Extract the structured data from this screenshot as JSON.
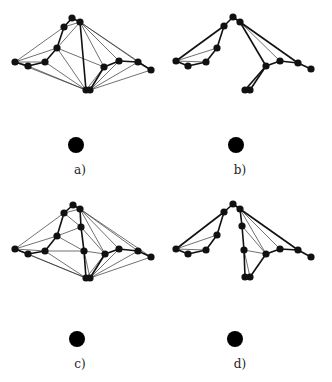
{
  "figure": {
    "panels": [
      {
        "id": "a",
        "label": "a)",
        "label_pos": [
          80,
          174
        ],
        "source_node": [
          76,
          145,
          8
        ],
        "nodes": {
          "t": [
            72,
            18
          ],
          "tl": [
            64,
            27
          ],
          "tr": [
            80,
            22
          ],
          "m": [
            57,
            48
          ],
          "l1": [
            15,
            62
          ],
          "l2": [
            28,
            66
          ],
          "l3": [
            45,
            62
          ],
          "r1": [
            104,
            67
          ],
          "r2": [
            119,
            61
          ],
          "r3": [
            138,
            62
          ],
          "r4": [
            151,
            70
          ],
          "b1": [
            86,
            90
          ],
          "b2": [
            90,
            90
          ]
        },
        "thick_edges": [
          [
            "t",
            "tl"
          ],
          [
            "t",
            "tr"
          ],
          [
            "tl",
            "m"
          ],
          [
            "m",
            "l3"
          ],
          [
            "l3",
            "l2"
          ],
          [
            "l2",
            "l1"
          ],
          [
            "tr",
            "b1"
          ],
          [
            "r1",
            "b2"
          ],
          [
            "r1",
            "r2"
          ],
          [
            "r2",
            "r3"
          ],
          [
            "r3",
            "r4"
          ]
        ],
        "thin_edges": [
          [
            "l1",
            "tl"
          ],
          [
            "l1",
            "m"
          ],
          [
            "l1",
            "l3"
          ],
          [
            "l1",
            "b1"
          ],
          [
            "l2",
            "b1"
          ],
          [
            "l3",
            "b1"
          ],
          [
            "m",
            "b1"
          ],
          [
            "m",
            "r1"
          ],
          [
            "m",
            "tr"
          ],
          [
            "tr",
            "r1"
          ],
          [
            "tr",
            "r2"
          ],
          [
            "tr",
            "r3"
          ],
          [
            "tr",
            "r4"
          ],
          [
            "r1",
            "b1"
          ],
          [
            "r2",
            "b2"
          ],
          [
            "r3",
            "b2"
          ],
          [
            "r4",
            "b2"
          ],
          [
            "tl",
            "tr"
          ]
        ]
      },
      {
        "id": "b",
        "label": "b)",
        "label_pos": [
          240,
          174
        ],
        "source_node": [
          236,
          145,
          8
        ],
        "nodes": {
          "t": [
            233,
            17
          ],
          "tl": [
            224,
            26
          ],
          "tr": [
            240,
            22
          ],
          "m": [
            217,
            48
          ],
          "l1": [
            176,
            61
          ],
          "l2": [
            188,
            66
          ],
          "l3": [
            206,
            62
          ],
          "r1": [
            266,
            66
          ],
          "r2": [
            280,
            61
          ],
          "r3": [
            298,
            63
          ],
          "r4": [
            311,
            69
          ],
          "b1": [
            245,
            90
          ],
          "b2": [
            250,
            90
          ]
        },
        "thick_edges": [
          [
            "t",
            "tl"
          ],
          [
            "t",
            "tr"
          ],
          [
            "tl",
            "m"
          ],
          [
            "tl",
            "l1"
          ],
          [
            "m",
            "l3"
          ],
          [
            "l3",
            "l2"
          ],
          [
            "l2",
            "l1"
          ],
          [
            "tr",
            "r1"
          ],
          [
            "tr",
            "r3"
          ],
          [
            "r1",
            "r2"
          ],
          [
            "r2",
            "r3"
          ],
          [
            "r3",
            "r4"
          ],
          [
            "r1",
            "b1"
          ],
          [
            "r1",
            "b2"
          ]
        ],
        "thin_edges": [
          [
            "l1",
            "m"
          ],
          [
            "l1",
            "l3"
          ],
          [
            "tr",
            "r2"
          ]
        ]
      },
      {
        "id": "c",
        "label": "c)",
        "label_pos": [
          80,
          368
        ],
        "source_node": [
          77,
          339,
          8
        ],
        "nodes": {
          "t": [
            73,
            205
          ],
          "tl": [
            64,
            213
          ],
          "tr": [
            80,
            209
          ],
          "c1": [
            81,
            227
          ],
          "m": [
            57,
            236
          ],
          "l1": [
            15,
            249
          ],
          "l2": [
            28,
            254
          ],
          "l3": [
            45,
            251
          ],
          "c2": [
            84,
            251
          ],
          "r1": [
            105,
            254
          ],
          "r2": [
            119,
            249
          ],
          "r3": [
            138,
            251
          ],
          "r4": [
            151,
            257
          ],
          "b1": [
            86,
            278
          ],
          "b2": [
            90,
            278
          ]
        },
        "thick_edges": [
          [
            "t",
            "tl"
          ],
          [
            "t",
            "tr"
          ],
          [
            "tl",
            "m"
          ],
          [
            "tr",
            "c1"
          ],
          [
            "c1",
            "c2"
          ],
          [
            "m",
            "l3"
          ],
          [
            "l3",
            "l2"
          ],
          [
            "l2",
            "l1"
          ],
          [
            "c2",
            "b1"
          ],
          [
            "r1",
            "b2"
          ],
          [
            "r1",
            "r2"
          ],
          [
            "r2",
            "r3"
          ],
          [
            "r3",
            "r4"
          ]
        ],
        "thin_edges": [
          [
            "l1",
            "tl"
          ],
          [
            "l1",
            "m"
          ],
          [
            "l1",
            "l3"
          ],
          [
            "l1",
            "b1"
          ],
          [
            "l2",
            "b1"
          ],
          [
            "l3",
            "b1"
          ],
          [
            "l3",
            "c2"
          ],
          [
            "m",
            "c1"
          ],
          [
            "m",
            "c2"
          ],
          [
            "tl",
            "c1"
          ],
          [
            "tl",
            "tr"
          ],
          [
            "c1",
            "r1"
          ],
          [
            "tr",
            "r2"
          ],
          [
            "tr",
            "r3"
          ],
          [
            "tr",
            "r4"
          ],
          [
            "tr",
            "r1"
          ],
          [
            "c2",
            "r1"
          ],
          [
            "c2",
            "b2"
          ],
          [
            "r1",
            "b1"
          ],
          [
            "r2",
            "b2"
          ],
          [
            "r3",
            "b2"
          ],
          [
            "r4",
            "b2"
          ]
        ]
      },
      {
        "id": "d",
        "label": "d)",
        "label_pos": [
          240,
          368
        ],
        "source_node": [
          235,
          339,
          8
        ],
        "nodes": {
          "t": [
            233,
            204
          ],
          "tl": [
            224,
            212
          ],
          "tr": [
            240,
            209
          ],
          "c1": [
            242,
            226
          ],
          "m": [
            217,
            235
          ],
          "l1": [
            176,
            249
          ],
          "l2": [
            188,
            254
          ],
          "l3": [
            206,
            250
          ],
          "c2": [
            244,
            250
          ],
          "r1": [
            266,
            254
          ],
          "r2": [
            280,
            249
          ],
          "r3": [
            298,
            250
          ],
          "r4": [
            311,
            257
          ],
          "b1": [
            245,
            277
          ],
          "b2": [
            250,
            277
          ]
        },
        "thick_edges": [
          [
            "t",
            "tl"
          ],
          [
            "t",
            "tr"
          ],
          [
            "tl",
            "m"
          ],
          [
            "tl",
            "l1"
          ],
          [
            "m",
            "l3"
          ],
          [
            "l3",
            "l2"
          ],
          [
            "l2",
            "l1"
          ],
          [
            "tr",
            "c1"
          ],
          [
            "c1",
            "c2"
          ],
          [
            "c2",
            "b1"
          ],
          [
            "tr",
            "r3"
          ],
          [
            "r1",
            "r2"
          ],
          [
            "r2",
            "r3"
          ],
          [
            "r3",
            "r4"
          ],
          [
            "r1",
            "b2"
          ]
        ],
        "thin_edges": [
          [
            "l1",
            "m"
          ],
          [
            "l1",
            "l3"
          ],
          [
            "tr",
            "r1"
          ],
          [
            "tr",
            "r2"
          ],
          [
            "c1",
            "r1"
          ],
          [
            "c2",
            "r1"
          ],
          [
            "c2",
            "b2"
          ]
        ]
      }
    ]
  }
}
